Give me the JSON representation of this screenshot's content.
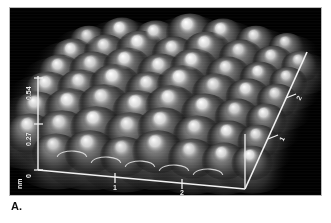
{
  "figure": {
    "caption": "A.",
    "kind": "stm-3d-surface-plot",
    "background_color": "#000000",
    "axis_color": "#f2f2f2",
    "frame_border_color": "#b9b9b9",
    "page_background": "#ffffff"
  },
  "chart_data": {
    "type": "heatmap",
    "render_style": "3d-surface",
    "title": "",
    "subtitle": "",
    "xlabel": "",
    "ylabel": "",
    "zlabel": "nm",
    "unit_label": "nm",
    "grid": false,
    "legend_position": "none",
    "colormap": "grayscale",
    "z_axis": {
      "label": "nm",
      "ticks": [
        {
          "value": 0,
          "label": "0"
        },
        {
          "value": 0.27,
          "label": "0.27"
        },
        {
          "value": 0.54,
          "label": "0.54"
        }
      ],
      "range": [
        0,
        0.54
      ],
      "unit": "nm"
    },
    "x_axis": {
      "ticks": [
        {
          "value": 1,
          "label": "1"
        },
        {
          "value": 2,
          "label": "2"
        }
      ],
      "range": [
        0,
        2.6
      ],
      "unit": "nm"
    },
    "depth_axis": {
      "ticks": [
        {
          "value": 1,
          "label": "1"
        },
        {
          "value": 2,
          "label": "2"
        }
      ],
      "range": [
        0,
        2.6
      ],
      "unit": "nm"
    },
    "origin_label": "0",
    "lattice": {
      "description": "hexagonal close-packed array of bright atomic protrusions",
      "rows": 7,
      "columns": 8,
      "peak_height_nm": 0.54,
      "peak_count": 52
    },
    "peaks": [
      {
        "row": 0,
        "col": 0,
        "x": 79,
        "y": 32,
        "r": 12,
        "b": 0.52
      },
      {
        "row": 0,
        "col": 1,
        "x": 112,
        "y": 25,
        "r": 13,
        "b": 0.95
      },
      {
        "row": 0,
        "col": 2,
        "x": 146,
        "y": 28,
        "r": 13,
        "b": 0.8
      },
      {
        "row": 0,
        "col": 3,
        "x": 180,
        "y": 22,
        "r": 14,
        "b": 1.0
      },
      {
        "row": 0,
        "col": 4,
        "x": 213,
        "y": 26,
        "r": 13,
        "b": 0.92
      },
      {
        "row": 0,
        "col": 5,
        "x": 246,
        "y": 32,
        "r": 12,
        "b": 0.7
      },
      {
        "row": 0,
        "col": 6,
        "x": 277,
        "y": 38,
        "r": 11,
        "b": 0.6
      },
      {
        "row": 1,
        "col": 0,
        "x": 63,
        "y": 46,
        "r": 13,
        "b": 0.88
      },
      {
        "row": 1,
        "col": 1,
        "x": 96,
        "y": 42,
        "r": 13,
        "b": 0.72
      },
      {
        "row": 1,
        "col": 2,
        "x": 130,
        "y": 39,
        "r": 14,
        "b": 0.96
      },
      {
        "row": 1,
        "col": 3,
        "x": 164,
        "y": 44,
        "r": 13,
        "b": 0.78
      },
      {
        "row": 1,
        "col": 4,
        "x": 197,
        "y": 40,
        "r": 14,
        "b": 0.94
      },
      {
        "row": 1,
        "col": 5,
        "x": 231,
        "y": 47,
        "r": 13,
        "b": 0.66
      },
      {
        "row": 1,
        "col": 6,
        "x": 263,
        "y": 52,
        "r": 12,
        "b": 0.74
      },
      {
        "row": 1,
        "col": 7,
        "x": 290,
        "y": 56,
        "r": 11,
        "b": 0.62
      },
      {
        "row": 2,
        "col": 0,
        "x": 50,
        "y": 62,
        "r": 13,
        "b": 0.8
      },
      {
        "row": 2,
        "col": 1,
        "x": 83,
        "y": 60,
        "r": 14,
        "b": 0.7
      },
      {
        "row": 2,
        "col": 2,
        "x": 117,
        "y": 56,
        "r": 14,
        "b": 0.96
      },
      {
        "row": 2,
        "col": 3,
        "x": 151,
        "y": 62,
        "r": 14,
        "b": 0.84
      },
      {
        "row": 2,
        "col": 4,
        "x": 184,
        "y": 57,
        "r": 14,
        "b": 1.0
      },
      {
        "row": 2,
        "col": 5,
        "x": 218,
        "y": 64,
        "r": 13,
        "b": 0.72
      },
      {
        "row": 2,
        "col": 6,
        "x": 250,
        "y": 68,
        "r": 12,
        "b": 0.86
      },
      {
        "row": 2,
        "col": 7,
        "x": 278,
        "y": 72,
        "r": 11,
        "b": 0.68
      },
      {
        "row": 3,
        "col": 0,
        "x": 38,
        "y": 80,
        "r": 14,
        "b": 0.86
      },
      {
        "row": 3,
        "col": 1,
        "x": 71,
        "y": 78,
        "r": 14,
        "b": 0.74
      },
      {
        "row": 3,
        "col": 2,
        "x": 105,
        "y": 74,
        "r": 15,
        "b": 0.98
      },
      {
        "row": 3,
        "col": 3,
        "x": 139,
        "y": 80,
        "r": 14,
        "b": 0.8
      },
      {
        "row": 3,
        "col": 4,
        "x": 172,
        "y": 75,
        "r": 15,
        "b": 0.94
      },
      {
        "row": 3,
        "col": 5,
        "x": 206,
        "y": 82,
        "r": 14,
        "b": 0.7
      },
      {
        "row": 3,
        "col": 6,
        "x": 238,
        "y": 86,
        "r": 13,
        "b": 0.88
      },
      {
        "row": 3,
        "col": 7,
        "x": 267,
        "y": 90,
        "r": 12,
        "b": 0.66
      },
      {
        "row": 4,
        "col": 0,
        "x": 27,
        "y": 100,
        "r": 14,
        "b": 0.82
      },
      {
        "row": 4,
        "col": 1,
        "x": 60,
        "y": 98,
        "r": 15,
        "b": 0.92
      },
      {
        "row": 4,
        "col": 2,
        "x": 94,
        "y": 94,
        "r": 15,
        "b": 0.76
      },
      {
        "row": 4,
        "col": 3,
        "x": 128,
        "y": 100,
        "r": 15,
        "b": 0.98
      },
      {
        "row": 4,
        "col": 4,
        "x": 161,
        "y": 95,
        "r": 15,
        "b": 0.84
      },
      {
        "row": 4,
        "col": 5,
        "x": 195,
        "y": 102,
        "r": 14,
        "b": 0.94
      },
      {
        "row": 4,
        "col": 6,
        "x": 227,
        "y": 106,
        "r": 13,
        "b": 0.7
      },
      {
        "row": 4,
        "col": 7,
        "x": 256,
        "y": 110,
        "r": 12,
        "b": 0.86
      },
      {
        "row": 5,
        "col": 0,
        "x": 20,
        "y": 122,
        "r": 14,
        "b": 0.78
      },
      {
        "row": 5,
        "col": 1,
        "x": 52,
        "y": 120,
        "r": 15,
        "b": 0.68
      },
      {
        "row": 5,
        "col": 2,
        "x": 86,
        "y": 116,
        "r": 15,
        "b": 0.94
      },
      {
        "row": 5,
        "col": 3,
        "x": 120,
        "y": 122,
        "r": 15,
        "b": 0.74
      },
      {
        "row": 5,
        "col": 4,
        "x": 153,
        "y": 117,
        "r": 15,
        "b": 0.9
      },
      {
        "row": 5,
        "col": 5,
        "x": 187,
        "y": 124,
        "r": 14,
        "b": 0.8
      },
      {
        "row": 5,
        "col": 6,
        "x": 219,
        "y": 128,
        "r": 13,
        "b": 0.92
      },
      {
        "row": 5,
        "col": 7,
        "x": 248,
        "y": 131,
        "r": 12,
        "b": 0.7
      },
      {
        "row": 6,
        "col": 1,
        "x": 46,
        "y": 142,
        "r": 14,
        "b": 0.6
      },
      {
        "row": 6,
        "col": 2,
        "x": 80,
        "y": 140,
        "r": 15,
        "b": 0.82
      },
      {
        "row": 6,
        "col": 3,
        "x": 114,
        "y": 145,
        "r": 14,
        "b": 0.66
      },
      {
        "row": 6,
        "col": 4,
        "x": 148,
        "y": 140,
        "r": 15,
        "b": 0.88
      },
      {
        "row": 6,
        "col": 5,
        "x": 182,
        "y": 147,
        "r": 14,
        "b": 0.72
      },
      {
        "row": 6,
        "col": 6,
        "x": 214,
        "y": 150,
        "r": 13,
        "b": 0.84
      },
      {
        "row": 6,
        "col": 7,
        "x": 242,
        "y": 152,
        "r": 12,
        "b": 0.94
      }
    ]
  }
}
